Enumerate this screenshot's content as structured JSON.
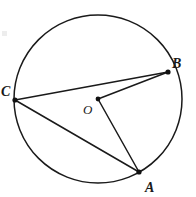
{
  "diagram": {
    "kind": "circle-geometry",
    "background_color": "#ffffff",
    "stroke_color": "#1a1a1a",
    "label_color": "#1a1a1a",
    "circle": {
      "name": "circle",
      "center_x": 98,
      "center_y": 99,
      "radius": 84,
      "stroke_width": 1.5
    },
    "points": [
      {
        "id": "A",
        "label": "A",
        "x": 139,
        "y": 172,
        "on_circle": true,
        "dot_radius": 2.6,
        "label_x": 145,
        "label_y": 192,
        "label_size": 14
      },
      {
        "id": "B",
        "label": "B",
        "x": 168,
        "y": 72,
        "on_circle": true,
        "dot_radius": 2.6,
        "label_x": 172,
        "label_y": 68,
        "label_size": 14
      },
      {
        "id": "C",
        "label": "C",
        "x": 15,
        "y": 100,
        "on_circle": true,
        "dot_radius": 2.6,
        "label_x": 1,
        "label_y": 96,
        "label_size": 14
      },
      {
        "id": "O",
        "label": "O",
        "x": 98,
        "y": 99,
        "on_circle": false,
        "dot_radius": 2.4,
        "label_x": 83,
        "label_y": 114,
        "label_size": 13
      }
    ],
    "segments": [
      {
        "id": "CB",
        "from": "C",
        "to": "B",
        "role": "chord",
        "x1": 15,
        "y1": 100,
        "x2": 168,
        "y2": 72
      },
      {
        "id": "CA",
        "from": "C",
        "to": "A",
        "role": "chord",
        "x1": 15,
        "y1": 100,
        "x2": 139,
        "y2": 172
      },
      {
        "id": "OB",
        "from": "O",
        "to": "B",
        "role": "radius",
        "x1": 98,
        "y1": 99,
        "x2": 168,
        "y2": 72
      },
      {
        "id": "OA",
        "from": "O",
        "to": "A",
        "role": "radius",
        "x1": 98,
        "y1": 99,
        "x2": 139,
        "y2": 172
      }
    ]
  }
}
